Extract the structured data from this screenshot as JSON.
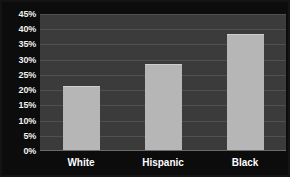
{
  "chart_data": {
    "type": "bar",
    "title": "",
    "xlabel": "",
    "ylabel": "",
    "categories": [
      "White",
      "Hispanic",
      "Black"
    ],
    "values": [
      21.5,
      28.5,
      38.5
    ],
    "ylim": [
      0,
      45
    ],
    "yticks": [
      0,
      5,
      10,
      15,
      20,
      25,
      30,
      35,
      40,
      45
    ],
    "ytick_labels": [
      "0%",
      "5%",
      "10%",
      "15%",
      "20%",
      "25%",
      "30%",
      "35%",
      "40%",
      "45%"
    ],
    "grid": true,
    "legend": false,
    "legend_position": "none"
  },
  "style": {
    "frame_color": "#0c0c0c",
    "plot_background": "#3b3b3b",
    "bar_color": "#b6b6b6",
    "gridline_color": "#555555",
    "label_color": "#ffffff"
  }
}
